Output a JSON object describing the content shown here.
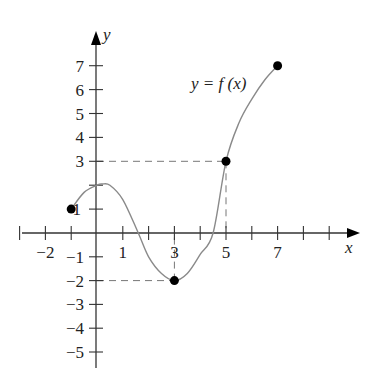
{
  "chart_data": {
    "type": "line",
    "title": "",
    "curve_label": "y = f (x)",
    "xlabel": "x",
    "ylabel": "y",
    "xlim": [
      -3,
      10
    ],
    "ylim": [
      -5.5,
      8
    ],
    "x_ticks": [
      -3,
      -2,
      -1,
      0,
      1,
      2,
      3,
      4,
      5,
      6,
      7,
      8,
      9
    ],
    "x_tick_labels": [
      "-2",
      "1",
      "3",
      "5",
      "7"
    ],
    "x_tick_label_values": [
      -2,
      1,
      3,
      5,
      7
    ],
    "y_ticks": [
      -5,
      -4,
      -3,
      -2,
      -1,
      1,
      2,
      3,
      4,
      5,
      6,
      7
    ],
    "y_tick_labels": [
      "7",
      "6",
      "5",
      "4",
      "3",
      "1",
      "-1",
      "-2",
      "-3",
      "-4",
      "-5"
    ],
    "y_tick_label_values": [
      7,
      6,
      5,
      4,
      3,
      1,
      -1,
      -2,
      -3,
      -4,
      -5
    ],
    "grid": false,
    "series": [
      {
        "name": "f(x)",
        "x": [
          -1,
          -0.5,
          0,
          0.2,
          0.5,
          1,
          1.6,
          2,
          2.5,
          3,
          3.5,
          4,
          4.5,
          5,
          5.5,
          6,
          6.5,
          7
        ],
        "values": [
          1,
          1.7,
          2.0,
          2.05,
          2.0,
          1.4,
          0,
          -1.0,
          -1.7,
          -2,
          -1.7,
          -0.9,
          0,
          3,
          4.6,
          5.6,
          6.4,
          7
        ]
      }
    ],
    "marked_points": [
      {
        "x": -1,
        "y": 1
      },
      {
        "x": 3,
        "y": -2
      },
      {
        "x": 5,
        "y": 3
      },
      {
        "x": 7,
        "y": 7
      }
    ],
    "guide_lines": [
      {
        "from": [
          0,
          3
        ],
        "to": [
          5,
          3
        ],
        "style": "dashed"
      },
      {
        "from": [
          5,
          3
        ],
        "to": [
          5,
          0
        ],
        "style": "dashed"
      },
      {
        "from": [
          0,
          -2
        ],
        "to": [
          3,
          -2
        ],
        "style": "dashed"
      },
      {
        "from": [
          3,
          -2
        ],
        "to": [
          3,
          0
        ],
        "style": "dashed"
      }
    ]
  },
  "labels": {
    "curve": "y = f (x)",
    "x_axis": "x",
    "y_axis": "y"
  },
  "colors": {
    "axis": "#333333",
    "curve": "#8a8a8a",
    "point": "#000000",
    "dashes": "#777777"
  }
}
